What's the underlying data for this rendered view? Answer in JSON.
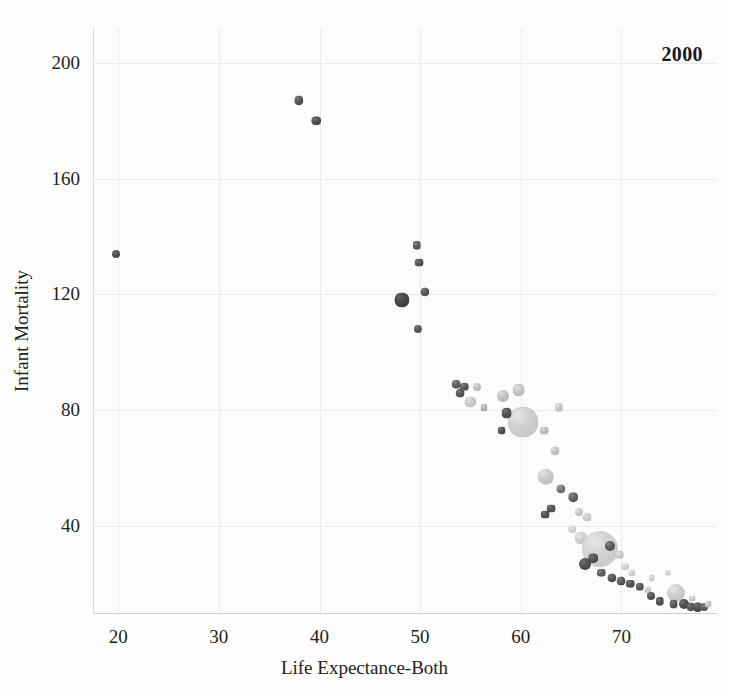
{
  "chart_data": {
    "type": "scatter",
    "title": "",
    "subtitle": "",
    "annotation": "2000",
    "xlabel": "Life Expectance-Both",
    "ylabel": "Infant Mortality",
    "xlim": [
      17.5,
      79.5
    ],
    "ylim": [
      10,
      212
    ],
    "xticks": [
      20,
      30,
      40,
      50,
      60,
      70
    ],
    "yticks": [
      40,
      80,
      120,
      160,
      200
    ],
    "grid": true,
    "legend": "none",
    "size_encodes": "population",
    "series": [
      {
        "name": "countries",
        "points": [
          {
            "x": 19.8,
            "y": 134,
            "r": 4.0,
            "c": "#4a4a4a"
          },
          {
            "x": 38.0,
            "y": 187,
            "r": 4.6,
            "c": "#4f4f4f"
          },
          {
            "x": 39.7,
            "y": 180,
            "r": 4.8,
            "c": "#4b4b4b"
          },
          {
            "x": 49.7,
            "y": 137,
            "r": 4.2,
            "c": "#555555"
          },
          {
            "x": 49.9,
            "y": 131,
            "r": 4.4,
            "c": "#4d4d4d"
          },
          {
            "x": 48.2,
            "y": 118,
            "r": 7.6,
            "c": "#3f3f3f"
          },
          {
            "x": 50.5,
            "y": 121,
            "r": 4.6,
            "c": "#525252"
          },
          {
            "x": 49.8,
            "y": 108,
            "r": 4.1,
            "c": "#505050"
          },
          {
            "x": 53.6,
            "y": 89,
            "r": 4.3,
            "c": "#565656"
          },
          {
            "x": 54.0,
            "y": 86,
            "r": 4.4,
            "c": "#4e4e4e"
          },
          {
            "x": 54.4,
            "y": 88,
            "r": 4.2,
            "c": "#525252"
          },
          {
            "x": 55.0,
            "y": 83,
            "r": 5.6,
            "c": "#c3c3c3"
          },
          {
            "x": 55.6,
            "y": 88,
            "r": 4.0,
            "c": "#b9b9b9"
          },
          {
            "x": 56.3,
            "y": 81,
            "r": 3.6,
            "c": "#a9a9a9"
          },
          {
            "x": 58.2,
            "y": 85,
            "r": 6.0,
            "c": "#b9b9b9"
          },
          {
            "x": 59.8,
            "y": 87,
            "r": 6.4,
            "c": "#bdbdbd"
          },
          {
            "x": 60.2,
            "y": 76,
            "r": 15.5,
            "c": "#c9c9c9"
          },
          {
            "x": 58.6,
            "y": 79,
            "r": 5.4,
            "c": "#4a4a4a"
          },
          {
            "x": 58.1,
            "y": 73,
            "r": 4.4,
            "c": "#4a4a4a"
          },
          {
            "x": 62.3,
            "y": 73,
            "r": 4.4,
            "c": "#b6b6b6"
          },
          {
            "x": 63.4,
            "y": 66,
            "r": 4.6,
            "c": "#bcbcbc"
          },
          {
            "x": 63.8,
            "y": 81,
            "r": 4.2,
            "c": "#c0c0c0"
          },
          {
            "x": 62.5,
            "y": 57,
            "r": 8.2,
            "c": "#c4c4c4"
          },
          {
            "x": 64.0,
            "y": 53,
            "r": 4.6,
            "c": "#6a6a6a"
          },
          {
            "x": 65.2,
            "y": 50,
            "r": 4.8,
            "c": "#5a5a5a"
          },
          {
            "x": 63.0,
            "y": 46,
            "r": 4.4,
            "c": "#4d4d4d"
          },
          {
            "x": 62.4,
            "y": 44,
            "r": 4.4,
            "c": "#4b4b4b"
          },
          {
            "x": 65.8,
            "y": 45,
            "r": 4.0,
            "c": "#c1c1c1"
          },
          {
            "x": 66.6,
            "y": 43,
            "r": 4.4,
            "c": "#c6c6c6"
          },
          {
            "x": 65.1,
            "y": 39,
            "r": 3.8,
            "c": "#cfcfcf"
          },
          {
            "x": 66.0,
            "y": 36,
            "r": 6.6,
            "c": "#cacaca"
          },
          {
            "x": 66.9,
            "y": 35,
            "r": 4.6,
            "c": "#4f4f4f"
          },
          {
            "x": 67.9,
            "y": 32,
            "r": 18.0,
            "c": "#cdcdcd"
          },
          {
            "x": 67.2,
            "y": 29,
            "r": 4.8,
            "c": "#4b4b4b"
          },
          {
            "x": 68.9,
            "y": 33,
            "r": 5.0,
            "c": "#535353"
          },
          {
            "x": 66.4,
            "y": 27,
            "r": 6.0,
            "c": "#4a4a4a"
          },
          {
            "x": 69.8,
            "y": 30,
            "r": 4.2,
            "c": "#c3c3c3"
          },
          {
            "x": 70.4,
            "y": 26,
            "r": 3.8,
            "c": "#cacaca"
          },
          {
            "x": 68.0,
            "y": 24,
            "r": 4.2,
            "c": "#595959"
          },
          {
            "x": 69.1,
            "y": 22,
            "r": 4.6,
            "c": "#4e4e4e"
          },
          {
            "x": 70.0,
            "y": 21,
            "r": 4.4,
            "c": "#525252"
          },
          {
            "x": 70.9,
            "y": 20,
            "r": 4.2,
            "c": "#4c4c4c"
          },
          {
            "x": 71.8,
            "y": 19,
            "r": 4.2,
            "c": "#505050"
          },
          {
            "x": 71.0,
            "y": 24,
            "r": 3.6,
            "c": "#c6c6c6"
          },
          {
            "x": 72.6,
            "y": 18,
            "r": 3.6,
            "c": "#c4c4c4"
          },
          {
            "x": 72.9,
            "y": 16,
            "r": 4.0,
            "c": "#4d4d4d"
          },
          {
            "x": 73.8,
            "y": 14,
            "r": 4.2,
            "c": "#4a4a4a"
          },
          {
            "x": 73.0,
            "y": 22,
            "r": 3.4,
            "c": "#cbcbcb"
          },
          {
            "x": 74.6,
            "y": 24,
            "r": 3.2,
            "c": "#d0d0d0"
          },
          {
            "x": 75.4,
            "y": 17,
            "r": 9.0,
            "c": "#c8c8c8"
          },
          {
            "x": 75.2,
            "y": 13,
            "r": 4.4,
            "c": "#505050"
          },
          {
            "x": 76.2,
            "y": 13,
            "r": 5.0,
            "c": "#474747"
          },
          {
            "x": 76.9,
            "y": 12,
            "r": 4.6,
            "c": "#4f4f4f"
          },
          {
            "x": 77.6,
            "y": 12,
            "r": 4.8,
            "c": "#4a4a4a"
          },
          {
            "x": 78.2,
            "y": 12,
            "r": 4.0,
            "c": "#555555"
          },
          {
            "x": 77.0,
            "y": 15,
            "r": 3.4,
            "c": "#c0c0c0"
          },
          {
            "x": 78.6,
            "y": 13,
            "r": 3.4,
            "c": "#bdbdbd"
          }
        ]
      }
    ]
  },
  "axes": {
    "x_title": "Life Expectance-Both",
    "y_title": "Infant Mortality",
    "x_tick_labels": [
      "20",
      "30",
      "40",
      "50",
      "60",
      "70"
    ],
    "y_tick_labels": [
      "40",
      "80",
      "120",
      "160",
      "200"
    ]
  },
  "annotation": {
    "year": "2000"
  },
  "colors": {
    "background": "#fcfcfc",
    "grid": "#eceaea",
    "axis": "#d8d6d6",
    "text": "#231f20"
  }
}
